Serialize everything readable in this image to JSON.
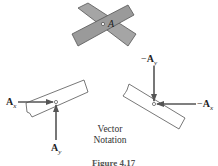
{
  "diagram": {
    "top_joint": {
      "label": "A",
      "description": "two crossed members pinned at A"
    },
    "left_member": {
      "force_x": {
        "symbol": "A",
        "subscript": "x",
        "direction": "right"
      },
      "force_y": {
        "symbol": "A",
        "subscript": "y",
        "direction": "up"
      }
    },
    "right_member": {
      "force_x": {
        "prefix": "−",
        "symbol": "A",
        "subscript": "x",
        "direction": "left"
      },
      "force_y": {
        "prefix": "−",
        "symbol": "A",
        "subscript": "y",
        "direction": "down"
      }
    },
    "notation_label": [
      "Vector",
      "Notation"
    ],
    "caption": "Figure 4.17"
  },
  "colors": {
    "member_fill": "#9a9a9a",
    "stroke": "#444444",
    "arrow": "#555555"
  }
}
